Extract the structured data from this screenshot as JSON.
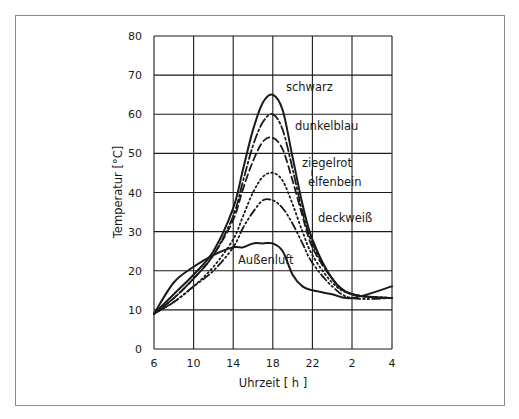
{
  "chart_data": {
    "type": "line",
    "title": "",
    "xlabel": "Uhrzeit [ h ]",
    "ylabel": "Temperatur [°C]",
    "ylim": [
      0,
      80
    ],
    "yticks": [
      0,
      10,
      20,
      30,
      40,
      50,
      60,
      70,
      80
    ],
    "xticks": [
      "6",
      "10",
      "14",
      "18",
      "22",
      "2",
      "4"
    ],
    "grid": true,
    "x": [
      6,
      8,
      10,
      12,
      14,
      15,
      16,
      17,
      18,
      19,
      20,
      21,
      22,
      24,
      26,
      28
    ],
    "series": [
      {
        "name": "schwarz",
        "style": "solid",
        "values": [
          9,
          14,
          19,
          25,
          36,
          46,
          56,
          63,
          65,
          61,
          49,
          37,
          28,
          18,
          14,
          13
        ]
      },
      {
        "name": "dunkelblau",
        "style": "dash-dot",
        "values": [
          9,
          13,
          18,
          24,
          34,
          43,
          52,
          58,
          60,
          56,
          46,
          35,
          27,
          18,
          14,
          13
        ]
      },
      {
        "name": "ziegelrot",
        "style": "dashed",
        "values": [
          9,
          13,
          18,
          24,
          33,
          41,
          48,
          53,
          54,
          51,
          43,
          34,
          26,
          18,
          14,
          13
        ]
      },
      {
        "name": "elfenbein",
        "style": "dotted",
        "values": [
          9,
          12,
          16,
          21,
          28,
          34,
          40,
          44,
          45,
          43,
          37,
          30,
          24,
          17,
          14,
          13
        ]
      },
      {
        "name": "deckweiß",
        "style": "dash-dot-dot",
        "values": [
          9,
          12,
          16,
          20,
          26,
          31,
          35,
          38,
          38,
          36,
          32,
          27,
          22,
          16,
          13,
          13
        ]
      },
      {
        "name": "Außenluft",
        "style": "solid",
        "values": [
          9,
          17,
          21,
          24,
          26,
          26,
          27,
          27,
          27,
          25,
          19,
          16,
          15,
          14,
          13,
          16
        ]
      }
    ]
  },
  "axes": {
    "xlabel": "Uhrzeit [ h ]",
    "ylabel": "Temperatur [°C]"
  },
  "labels": {
    "schwarz": "schwarz",
    "dunkelblau": "dunkelblau",
    "ziegelrot": "ziegelrot",
    "elfenbein": "elfenbein",
    "deckweiss": "deckweiß",
    "aussenluft": "Außenluft"
  },
  "colors": {
    "ink": "#1a1a1a",
    "frame": "#8a8a8a",
    "background": "#ffffff"
  }
}
